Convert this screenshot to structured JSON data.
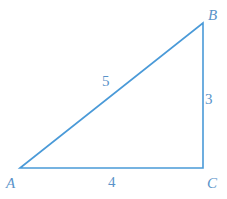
{
  "diagram": {
    "type": "right-triangle",
    "line_color": "#4a9ad8",
    "label_color": "#5a93c9",
    "vertices": [
      {
        "name": "A",
        "x": 20,
        "y": 168,
        "label_x": 6,
        "label_y": 188
      },
      {
        "name": "B",
        "x": 203,
        "y": 23,
        "label_x": 208,
        "label_y": 20
      },
      {
        "name": "C",
        "x": 203,
        "y": 168,
        "label_x": 207,
        "label_y": 188
      }
    ],
    "sides": [
      {
        "between": "AB",
        "label": "5",
        "label_x": 102,
        "label_y": 86
      },
      {
        "between": "BC",
        "label": "3",
        "label_x": 205,
        "label_y": 104
      },
      {
        "between": "AC",
        "label": "4",
        "label_x": 108,
        "label_y": 187
      }
    ],
    "right_angle_at": "C"
  }
}
